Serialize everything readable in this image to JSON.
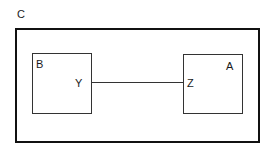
{
  "diagram": {
    "outer": {
      "label": "C"
    },
    "boxes": [
      {
        "label": "B",
        "port_label": "Y"
      },
      {
        "label": "A",
        "port_label": "Z"
      }
    ],
    "connection": {
      "from": "Y",
      "to": "Z"
    }
  }
}
